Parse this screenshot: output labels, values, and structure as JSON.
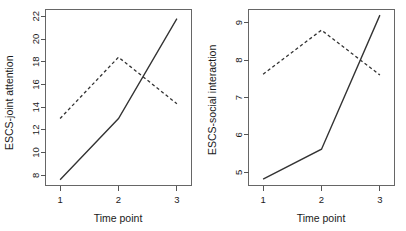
{
  "figure": {
    "background": "#ffffff",
    "line_color": "#333333",
    "axis_color": "#555555",
    "panel_count": 2
  },
  "chart_data": [
    {
      "type": "line",
      "panel": "left",
      "title": "",
      "xlabel": "Time point",
      "ylabel": "ESCS-joint attention",
      "x": [
        1,
        2,
        3
      ],
      "xtick_labels": [
        "1",
        "2",
        "3"
      ],
      "ytick_labels": [
        "8",
        "10",
        "12",
        "14",
        "16",
        "18",
        "20",
        "22"
      ],
      "yticks": [
        8,
        10,
        12,
        14,
        16,
        18,
        20,
        22
      ],
      "xlim": [
        0.75,
        3.25
      ],
      "ylim": [
        7.1,
        22.6
      ],
      "grid": false,
      "legend": "none",
      "series": [
        {
          "name": "solid",
          "style": "solid",
          "values": [
            7.6,
            13.0,
            21.8
          ]
        },
        {
          "name": "dashed",
          "style": "dashed",
          "values": [
            13.0,
            18.4,
            14.3
          ]
        }
      ]
    },
    {
      "type": "line",
      "panel": "right",
      "title": "",
      "xlabel": "Time point",
      "ylabel": "ESCS-social interaction",
      "x": [
        1,
        2,
        3
      ],
      "xtick_labels": [
        "1",
        "2",
        "3"
      ],
      "ytick_labels": [
        "5",
        "6",
        "7",
        "8",
        "9"
      ],
      "yticks": [
        5,
        6,
        7,
        8,
        9
      ],
      "xlim": [
        0.75,
        3.25
      ],
      "ylim": [
        4.65,
        9.35
      ],
      "grid": false,
      "legend": "none",
      "series": [
        {
          "name": "solid",
          "style": "solid",
          "values": [
            4.82,
            5.62,
            9.2
          ]
        },
        {
          "name": "dashed",
          "style": "dashed",
          "values": [
            7.62,
            8.8,
            7.6
          ]
        }
      ]
    }
  ]
}
